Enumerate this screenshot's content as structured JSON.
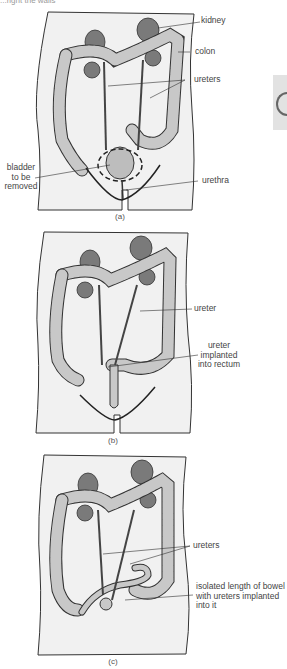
{
  "page": {
    "cut_off_header": "...right the walls"
  },
  "colors": {
    "body_fill": "#f1f1f1",
    "outline": "#333333",
    "colon_fill": "#c8c8c8",
    "kidney_fill": "#7a7a7a",
    "bladder_fill": "#bdbdbd",
    "side_tab": "#e2e2e2"
  },
  "panels": [
    {
      "id": "a",
      "caption": "(a)",
      "labels": {
        "kidney": "kidney",
        "colon": "colon",
        "ureters": "ureters",
        "bladder_l1": "bladder",
        "bladder_l2": "to be",
        "bladder_l3": "removed",
        "urethra": "urethra"
      }
    },
    {
      "id": "b",
      "caption": "(b)",
      "labels": {
        "ureter": "ureter",
        "implant_l1": "ureter",
        "implant_l2": "implanted",
        "implant_l3": "into rectum"
      }
    },
    {
      "id": "c",
      "caption": "(c)",
      "labels": {
        "ureters": "ureters",
        "bowel_l1": "isolated length of bowel",
        "bowel_l2": "with ureters implanted",
        "bowel_l3": "into it"
      }
    }
  ]
}
